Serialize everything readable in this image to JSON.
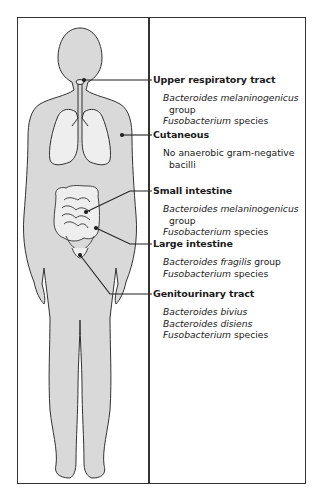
{
  "figure": {
    "colors": {
      "body_fill": "#d9d9d9",
      "organ_fill": "#eeeeee",
      "outline": "#333333",
      "frame": "#333333"
    }
  },
  "sites": [
    {
      "title": "Upper respiratory tract",
      "lines": [
        {
          "italic": "Bacteroides melaninogenicus",
          "plain": ""
        },
        {
          "italic": "",
          "plain": "group",
          "indent": true
        },
        {
          "italic": "Fusobacterium",
          "plain": " species"
        }
      ]
    },
    {
      "title": "Cutaneous",
      "lines": [
        {
          "italic": "",
          "plain": "No anaerobic gram-negative"
        },
        {
          "italic": "",
          "plain": "bacilli",
          "indent": true
        }
      ]
    },
    {
      "title": "Small intestine",
      "lines": [
        {
          "italic": "Bacteroides melaninogenicus",
          "plain": ""
        },
        {
          "italic": "",
          "plain": "group",
          "indent": true
        },
        {
          "italic": "Fusobacterium",
          "plain": " species"
        }
      ]
    },
    {
      "title": "Large intestine",
      "lines": [
        {
          "italic": "Bacteroides fragilis",
          "plain": " group"
        },
        {
          "italic": "Fusobacterium",
          "plain": " species"
        }
      ]
    },
    {
      "title": "Genitourinary tract",
      "lines": [
        {
          "italic": "Bacteroides bivius",
          "plain": ""
        },
        {
          "italic": "Bacteroides disiens",
          "plain": ""
        },
        {
          "italic": "Fusobacterium",
          "plain": " species"
        }
      ]
    }
  ]
}
